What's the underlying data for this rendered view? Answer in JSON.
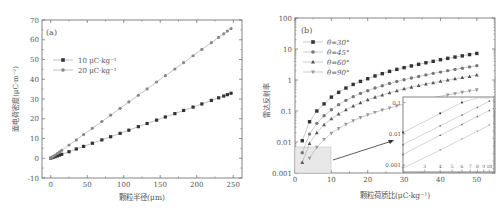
{
  "chart_data": [
    {
      "type": "line",
      "panel_label": "(a)",
      "title": "",
      "xlabel": "颗粒半径(μm)",
      "ylabel": "面电荷密度(μC·m⁻²)",
      "xlim": [
        -12,
        262
      ],
      "ylim": [
        -10,
        70
      ],
      "xticks": [
        0,
        50,
        100,
        150,
        200,
        250
      ],
      "yticks": [
        -10,
        0,
        10,
        20,
        30,
        40,
        50,
        60,
        70
      ],
      "grid": false,
      "legend_position": "upper-left",
      "x": [
        0,
        3,
        6,
        9,
        12,
        15,
        25,
        35,
        45,
        57,
        70,
        82,
        95,
        107,
        120,
        132,
        145,
        157,
        170,
        182,
        195,
        207,
        220,
        230,
        237,
        242,
        247
      ],
      "series": [
        {
          "name": "10 μC·kg⁻¹",
          "marker": "square",
          "color": "#333333",
          "values": [
            0,
            0.4,
            0.8,
            1.2,
            1.6,
            2.0,
            3.3,
            4.7,
            6.0,
            7.6,
            9.3,
            10.9,
            12.6,
            14.2,
            16.0,
            17.6,
            19.3,
            20.9,
            22.6,
            24.2,
            25.9,
            27.5,
            29.3,
            30.6,
            31.5,
            32.2,
            32.9
          ]
        },
        {
          "name": "20 μC·kg⁻¹",
          "marker": "circle",
          "color": "#888888",
          "values": [
            0,
            0.8,
            1.6,
            2.4,
            3.2,
            4.0,
            6.7,
            9.3,
            12.0,
            15.2,
            18.6,
            21.8,
            25.3,
            28.5,
            31.9,
            35.1,
            38.6,
            41.8,
            45.2,
            48.4,
            51.9,
            55.1,
            58.5,
            61.2,
            63.0,
            64.4,
            65.7
          ]
        }
      ]
    },
    {
      "type": "line",
      "panel_label": "(b)",
      "title": "",
      "xlabel": "颗粒荷质比(μC·kg⁻¹)",
      "ylabel": "雷达反射率",
      "xlim": [
        0,
        55
      ],
      "ylim": [
        0.001,
        100
      ],
      "yscale": "log",
      "xticks": [
        0,
        10,
        20,
        30,
        40,
        50
      ],
      "ytick_labels": [
        "0.001",
        "0.01",
        "0.1",
        "1",
        "10",
        "100"
      ],
      "grid": false,
      "legend_position": "upper-left",
      "x": [
        2,
        4,
        6,
        8,
        10,
        12,
        14,
        16,
        18,
        20,
        22,
        24,
        26,
        28,
        30,
        32,
        34,
        36,
        38,
        40,
        42,
        44,
        46,
        48,
        50
      ],
      "series": [
        {
          "name": "θ=30°",
          "marker": "square",
          "color": "#333333",
          "values": [
            0.011,
            0.045,
            0.1,
            0.17,
            0.28,
            0.4,
            0.55,
            0.72,
            0.9,
            1.1,
            1.35,
            1.6,
            1.9,
            2.2,
            2.5,
            2.85,
            3.2,
            3.6,
            4.0,
            4.5,
            5.0,
            5.5,
            6.0,
            6.6,
            7.2
          ]
        },
        {
          "name": "θ=45°",
          "marker": "circle",
          "color": "#777777",
          "values": [
            0.0045,
            0.018,
            0.04,
            0.07,
            0.11,
            0.16,
            0.22,
            0.29,
            0.37,
            0.45,
            0.55,
            0.65,
            0.77,
            0.89,
            1.02,
            1.16,
            1.3,
            1.46,
            1.63,
            1.8,
            2.0,
            2.2,
            2.4,
            2.65,
            2.9
          ]
        },
        {
          "name": "θ=60°",
          "marker": "triangle-up",
          "color": "#555555",
          "values": [
            0.0022,
            0.009,
            0.02,
            0.036,
            0.056,
            0.08,
            0.11,
            0.145,
            0.185,
            0.23,
            0.28,
            0.33,
            0.39,
            0.45,
            0.52,
            0.59,
            0.66,
            0.74,
            0.82,
            0.91,
            1.0,
            1.1,
            1.2,
            1.3,
            1.45
          ]
        },
        {
          "name": "θ=90°",
          "marker": "triangle-down",
          "color": "#999999",
          "values": [
            0.0008,
            0.003,
            0.0068,
            0.012,
            0.019,
            0.027,
            0.037,
            0.048,
            0.061,
            0.075,
            0.09,
            0.107,
            0.125,
            0.145,
            0.166,
            0.19,
            0.21,
            0.24,
            0.27,
            0.3,
            0.33,
            0.36,
            0.4,
            0.44,
            0.48
          ]
        }
      ],
      "inset": {
        "description": "zoomed log-log view of region x 0–10, y 0.001–0.007",
        "xtick_labels": [
          "2",
          "3",
          "4",
          "5",
          "6",
          "7",
          "8",
          "9",
          "10"
        ],
        "ytick_labels": [
          "0.001",
          "0.01",
          "0.1"
        ]
      }
    }
  ],
  "panels": {
    "a": {
      "label": "(a)",
      "xlabel": "颗粒半径(μm)",
      "ylabel": "面电荷密度(μC·m⁻²)",
      "xtick_labels": [
        "0",
        "50",
        "100",
        "150",
        "200",
        "250"
      ],
      "ytick_labels": [
        "70",
        "60",
        "50",
        "40",
        "30",
        "20",
        "10",
        "0",
        "-10"
      ],
      "legend": [
        "10 μC·kg⁻¹",
        "20 μC·kg⁻¹"
      ]
    },
    "b": {
      "label": "(b)",
      "xlabel": "颗粒荷质比(μC·kg⁻¹)",
      "ylabel": "雷达反射率",
      "xtick_labels": [
        "0",
        "10",
        "20",
        "30",
        "40",
        "50"
      ],
      "ytick_labels": [
        "100",
        "10",
        "1",
        "0.1",
        "0.01",
        "0.001"
      ],
      "legend": [
        "θ=30°",
        "θ=45°",
        "θ=60°",
        "θ=90°"
      ],
      "inset_xtick_labels": [
        "2",
        "3",
        "4",
        "5",
        "6",
        "7",
        "8",
        "9",
        "10"
      ],
      "inset_ytick_labels": [
        "0.1",
        "0.01",
        "0.001"
      ]
    }
  }
}
